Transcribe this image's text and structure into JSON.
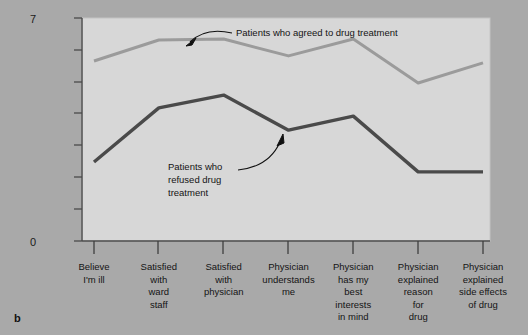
{
  "figure": {
    "panel_letter": "b",
    "background_color": "#a9a9a9",
    "plot_background_color": "#d7d7d7"
  },
  "chart_data": {
    "type": "line",
    "title": "",
    "subtitle": "",
    "xlabel": "",
    "ylabel": "",
    "ylim": [
      0,
      7
    ],
    "y_tick_labels": [
      "0",
      "7"
    ],
    "y_ticks_values": [
      0,
      1,
      2,
      3,
      4,
      5,
      6,
      7
    ],
    "grid": false,
    "legend_position": "inline-annotation",
    "categories": [
      "Believe I'm ill",
      "Satisfied with ward staff",
      "Satisfied with physician",
      "Physician understands me",
      "Physician has my best interests in mind",
      "Physician explained reason for drug",
      "Physician explained side effects of drug"
    ],
    "category_lines": [
      [
        "Believe",
        "I'm ill"
      ],
      [
        "Satisfied",
        "with",
        "ward",
        "staff"
      ],
      [
        "Satisfied",
        "with",
        "physician"
      ],
      [
        "Physician",
        "understands",
        "me"
      ],
      [
        "Physician",
        "has my",
        "best",
        "interests",
        "in mind"
      ],
      [
        "Physician",
        "explained",
        "reason",
        "for",
        "drug"
      ],
      [
        "Physician",
        "explained",
        "side effects",
        "of drug"
      ]
    ],
    "series": [
      {
        "name": "Patients who agreed to drug treatment",
        "color": "#9b9b9b",
        "values": [
          5.65,
          6.31,
          6.34,
          5.81,
          6.34,
          4.96,
          5.59
        ]
      },
      {
        "name": "Patients who refused drug treatment",
        "color": "#4a4a4a",
        "values": [
          2.48,
          4.18,
          4.58,
          3.48,
          3.92,
          2.17,
          2.17
        ]
      }
    ],
    "annotations": [
      {
        "id": "agreed-annotation",
        "text": "Patients who agreed to drug treatment",
        "points_to_series": "Patients who agreed to drug treatment"
      },
      {
        "id": "refused-annotation",
        "text_lines": [
          "Patients who",
          "refused drug",
          "treatment"
        ],
        "points_to_series": "Patients who refused drug treatment"
      }
    ]
  },
  "annotation_agreed": {
    "label": "Patients who agreed to drug treatment"
  },
  "annotation_refused": {
    "line1": "Patients who",
    "line2": "refused drug",
    "line3": "treatment"
  },
  "axis": {
    "y_top_label": "7",
    "y_bottom_label": "0"
  }
}
